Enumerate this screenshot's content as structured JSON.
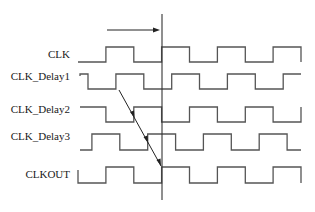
{
  "signals": [
    {
      "name": "CLK",
      "initial": 0,
      "edges": [
        1,
        2,
        3,
        4,
        5,
        6,
        7,
        8
      ],
      "start_marker": false,
      "end_drop": true
    },
    {
      "name": "CLK_Delay1",
      "initial": 1,
      "edges": [
        0.36,
        1.36,
        2.36,
        3.36,
        4.36,
        5.36,
        6.36,
        7.36
      ],
      "start_marker": true,
      "end_drop": false
    },
    {
      "name": "CLK_Delay2",
      "initial": 1,
      "edges": [
        1,
        2,
        3,
        4,
        5,
        6,
        7,
        8
      ],
      "start_marker": false,
      "end_drop": false,
      "end_rise": true
    },
    {
      "name": "CLK_Delay3",
      "initial": 0,
      "edges": [
        0.5,
        1.5,
        2.5,
        3.5,
        4.5,
        5.5,
        6.5,
        7.5
      ],
      "start_marker": false,
      "end_drop": false
    },
    {
      "name": "CLKOUT",
      "initial": 0,
      "edges": [
        1,
        2,
        3,
        4,
        5,
        6,
        7,
        8
      ],
      "start_marker": true,
      "end_drop": true
    }
  ],
  "time_units_visible": 8,
  "reference_time": 3,
  "propagation_arrow": {
    "from_signal": "CLK_Delay1",
    "to_signal": "CLKOUT",
    "via": [
      "CLK_Delay2",
      "CLK_Delay3"
    ]
  },
  "top_arrow": {
    "direction": "right"
  }
}
